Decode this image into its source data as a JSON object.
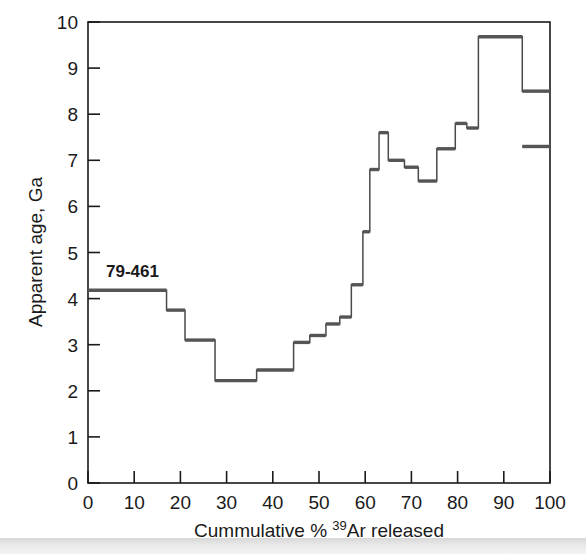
{
  "figure": {
    "kind": "ar-ar-age-spectrum",
    "background_color": "#ffffff",
    "line_color": "#555555",
    "axis_color": "#1a1a1a"
  },
  "annotation": {
    "sample_label": "79-461"
  },
  "axes": {
    "x_title_parts": {
      "before": "Cummulative % ",
      "superscript": "39",
      "after": "Ar released"
    },
    "x_title_full": "Cummulative % 39Ar released",
    "y_title": "Apparent age, Ga",
    "x_ticks": [
      "0",
      "10",
      "20",
      "30",
      "40",
      "50",
      "60",
      "70",
      "80",
      "90",
      "100"
    ],
    "y_ticks": [
      "0",
      "1",
      "2",
      "3",
      "4",
      "5",
      "6",
      "7",
      "8",
      "9",
      "10"
    ]
  },
  "chart_data": {
    "type": "area",
    "title": "",
    "subtitle": "",
    "xlabel": "Cummulative % 39Ar released",
    "ylabel": "Apparent age, Ga",
    "xlim": [
      0,
      100
    ],
    "ylim": [
      0,
      10
    ],
    "grid": false,
    "legend": "none",
    "annotations": [
      {
        "text": "79-461",
        "x": 4,
        "y": 4.8
      }
    ],
    "series_name": "79-461 apparent age spectrum",
    "step_edges": [
      0,
      17,
      21,
      27.5,
      36.5,
      44.5,
      48,
      51.5,
      54.5,
      57,
      59.5,
      61,
      63,
      65,
      68.5,
      71.5,
      75.5,
      79.5,
      82,
      84.5,
      94,
      100
    ],
    "step_values": [
      4.18,
      3.75,
      3.1,
      2.22,
      2.45,
      3.05,
      3.2,
      3.45,
      3.6,
      4.3,
      5.45,
      6.8,
      7.6,
      7.0,
      6.85,
      6.55,
      7.25,
      7.8,
      7.7,
      9.68,
      8.5,
      7.3
    ],
    "steps": [
      {
        "x_start": 0,
        "x_end": 17,
        "age": 4.18
      },
      {
        "x_start": 17,
        "x_end": 21,
        "age": 3.75
      },
      {
        "x_start": 21,
        "x_end": 27.5,
        "age": 3.1
      },
      {
        "x_start": 27.5,
        "x_end": 36.5,
        "age": 2.22
      },
      {
        "x_start": 36.5,
        "x_end": 44.5,
        "age": 2.45
      },
      {
        "x_start": 44.5,
        "x_end": 48,
        "age": 3.05
      },
      {
        "x_start": 48,
        "x_end": 51.5,
        "age": 3.2
      },
      {
        "x_start": 51.5,
        "x_end": 54.5,
        "age": 3.45
      },
      {
        "x_start": 54.5,
        "x_end": 57,
        "age": 3.6
      },
      {
        "x_start": 57,
        "x_end": 59.5,
        "age": 4.3
      },
      {
        "x_start": 59.5,
        "x_end": 61,
        "age": 5.45
      },
      {
        "x_start": 61,
        "x_end": 63,
        "age": 6.8
      },
      {
        "x_start": 63,
        "x_end": 65,
        "age": 7.6
      },
      {
        "x_start": 65,
        "x_end": 68.5,
        "age": 7.0
      },
      {
        "x_start": 68.5,
        "x_end": 71.5,
        "age": 6.85
      },
      {
        "x_start": 71.5,
        "x_end": 75.5,
        "age": 6.55
      },
      {
        "x_start": 75.5,
        "x_end": 79.5,
        "age": 7.25
      },
      {
        "x_start": 79.5,
        "x_end": 82,
        "age": 7.8
      },
      {
        "x_start": 82,
        "x_end": 84.5,
        "age": 7.7
      },
      {
        "x_start": 84.5,
        "x_end": 94,
        "age": 9.68
      },
      {
        "x_start": 94,
        "x_end": 100,
        "age": 8.5
      },
      {
        "x_start": 100,
        "x_end": 100,
        "age": 7.3
      }
    ]
  }
}
